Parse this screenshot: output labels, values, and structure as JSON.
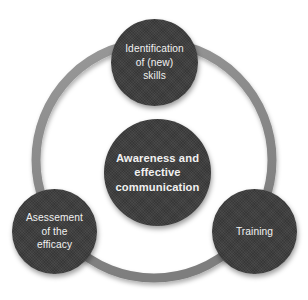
{
  "diagram": {
    "type": "circular-relationship-diagram",
    "background_color": "#ffffff",
    "ring": {
      "name": "connector-ring",
      "color": "#8a8a8a",
      "shadow_color": "#bdbdbd",
      "stroke_width_px": 9,
      "center_x": 154,
      "center_y": 160,
      "radius_px": 118
    },
    "node_fill_color": "#3b3b3b",
    "node_text_color": "#f1f1f1",
    "center_node": {
      "name": "awareness-node",
      "label": "Awareness and\neffective\ncommunication",
      "emphasis": "bold",
      "center_x": 157,
      "center_y": 172,
      "diameter_px": 107
    },
    "satellite_nodes": [
      {
        "name": "identification-node",
        "label": "Identification\nof (new)\nskills",
        "position": "top",
        "center_x": 154,
        "center_y": 62,
        "diameter_px": 87
      },
      {
        "name": "assessment-node",
        "label": "Asessement\nof the\nefficacy",
        "position": "bottom-left",
        "center_x": 54,
        "center_y": 231,
        "diameter_px": 85
      },
      {
        "name": "training-node",
        "label": "Training",
        "position": "bottom-right",
        "center_x": 254,
        "center_y": 231,
        "diameter_px": 85
      }
    ]
  }
}
